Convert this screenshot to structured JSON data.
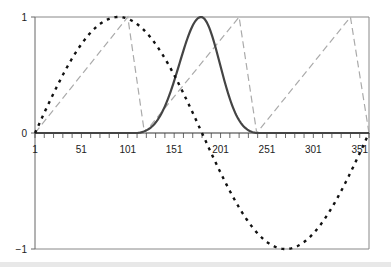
{
  "chart_data": {
    "type": "line",
    "title": "",
    "xlabel": "",
    "ylabel": "",
    "xlim": [
      1,
      361
    ],
    "ylim": [
      -1,
      1
    ],
    "x_tick_labels": [
      "1",
      "51",
      "101",
      "151",
      "201",
      "251",
      "301",
      "351"
    ],
    "x_tick_values": [
      1,
      51,
      101,
      151,
      201,
      251,
      301,
      351
    ],
    "y_tick_labels": [
      "-1",
      "0",
      "1"
    ],
    "y_tick_values": [
      -1,
      0,
      1
    ],
    "grid": false,
    "legend": null,
    "series": [
      {
        "name": "sine",
        "style": "dotted",
        "color": "#111111",
        "description": "sin((x-1) degrees), peak 1 at x=91, trough -1 at x=271",
        "x": [
          1,
          31,
          61,
          91,
          121,
          151,
          181,
          211,
          241,
          271,
          301,
          331,
          361
        ],
        "values": [
          0,
          0.5,
          0.87,
          1,
          0.87,
          0.5,
          0,
          -0.5,
          -0.87,
          -1,
          -0.87,
          -0.5,
          0
        ]
      },
      {
        "name": "sawtooth",
        "style": "dashed",
        "color": "#aaaaaa",
        "description": "linear ramp 0->1 then sharp drop to 0",
        "x": [
          1,
          101,
          119,
          221,
          240,
          341,
          361
        ],
        "values": [
          0,
          1,
          0,
          1,
          0,
          1,
          0
        ]
      },
      {
        "name": "pulse",
        "style": "solid",
        "color": "#444444",
        "description": "smooth bell-shaped pulse from x~111 to x~240, peak 1 at x~180",
        "x": [
          1,
          111,
          130,
          150,
          165,
          180,
          195,
          210,
          225,
          240,
          361
        ],
        "values": [
          0,
          0,
          0.1,
          0.45,
          0.85,
          1,
          0.85,
          0.45,
          0.1,
          0,
          0
        ]
      }
    ]
  }
}
